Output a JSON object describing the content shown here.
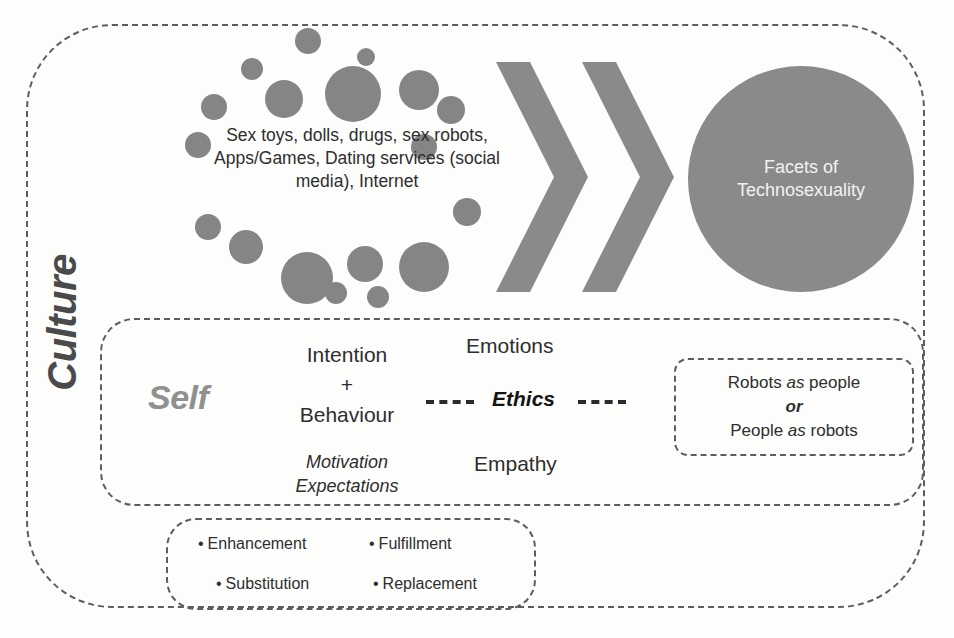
{
  "diagram": {
    "culture_label": "Culture",
    "cluster": {
      "text": "Sex toys, dolls, drugs, sex robots, Apps/Games, Dating services (social media), Internet",
      "dots": [
        {
          "x": 56,
          "y": 30,
          "r": 11
        },
        {
          "x": 110,
          "y": 0,
          "r": 13
        },
        {
          "x": 172,
          "y": 20,
          "r": 9
        },
        {
          "x": 16,
          "y": 66,
          "r": 13
        },
        {
          "x": 80,
          "y": 52,
          "r": 19
        },
        {
          "x": 140,
          "y": 38,
          "r": 28
        },
        {
          "x": 214,
          "y": 42,
          "r": 20
        },
        {
          "x": 252,
          "y": 68,
          "r": 14
        },
        {
          "x": 0,
          "y": 104,
          "r": 13
        },
        {
          "x": 226,
          "y": 106,
          "r": 13
        },
        {
          "x": 10,
          "y": 186,
          "r": 13
        },
        {
          "x": 268,
          "y": 170,
          "r": 14
        },
        {
          "x": 44,
          "y": 202,
          "r": 17
        },
        {
          "x": 96,
          "y": 224,
          "r": 26
        },
        {
          "x": 162,
          "y": 218,
          "r": 18
        },
        {
          "x": 214,
          "y": 214,
          "r": 25
        },
        {
          "x": 140,
          "y": 254,
          "r": 11
        },
        {
          "x": 182,
          "y": 258,
          "r": 11
        }
      ]
    },
    "chevrons": {
      "count": 2,
      "name": "process-arrow"
    },
    "facets_circle": {
      "line1": "Facets of",
      "line2": "Technosexuality"
    },
    "self_band": {
      "self_label": "Self",
      "intention": "Intention",
      "plus": "+",
      "behaviour": "Behaviour",
      "motivation": "Motivation",
      "expectations": "Expectations",
      "emotions": "Emotions",
      "empathy": "Empathy",
      "ethics": "Ethics",
      "connector_left": "- - -",
      "connector_right": "- - -",
      "robots_box": {
        "line1_pre": "Robots ",
        "line1_em": "as",
        "line1_post": " people",
        "or": "or",
        "line3_pre": "People ",
        "line3_em": "as",
        "line3_post": " robots"
      }
    },
    "outcomes": [
      {
        "bullet": "•",
        "label": "Enhancement"
      },
      {
        "bullet": "•",
        "label": "Fulfillment"
      },
      {
        "bullet": "•",
        "label": "Substitution"
      },
      {
        "bullet": "•",
        "label": "Replacement"
      }
    ],
    "colors": {
      "dot_gray": "#858585",
      "circle_gray": "#8a8a8a",
      "self_gray": "#909090",
      "culture_gray": "#4a4a4a",
      "dash_gray": "#5d5d5d",
      "text_dark": "#2e2e2e"
    }
  }
}
